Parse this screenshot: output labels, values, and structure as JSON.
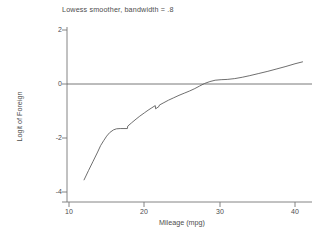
{
  "chart_data": {
    "type": "line",
    "title": "Lowess smoother, bandwidth = .8",
    "xlabel": "Mileage (mpg)",
    "ylabel": "Logit of Foreign",
    "xlim": [
      9,
      42
    ],
    "ylim": [
      -4.3,
      2.4
    ],
    "xticks": [
      10,
      20,
      30,
      40
    ],
    "xtick_labels": [
      "10",
      "20",
      "30",
      "40"
    ],
    "yticks": [
      2,
      0,
      -2,
      -4
    ],
    "ytick_labels": [
      "2",
      "0",
      "-2",
      "-4"
    ],
    "grid": false,
    "legend": null,
    "line_color": "#555555",
    "reference_lines": [
      {
        "name": "zero-line",
        "orientation": "horizontal",
        "y": 0,
        "color": "#555555"
      }
    ],
    "series": [
      {
        "name": "lowess-smooth",
        "x": [
          12.0,
          12.6,
          13.2,
          13.8,
          14.2,
          14.6,
          15.0,
          15.4,
          15.9,
          16.3,
          16.8,
          17.3,
          17.75,
          17.8,
          18.3,
          18.9,
          19.4,
          20.0,
          20.5,
          21.0,
          21.45,
          21.5,
          21.95,
          22.0,
          22.6,
          23.2,
          23.9,
          24.6,
          25.3,
          26.0,
          26.7,
          27.3,
          28.0,
          28.7,
          29.4,
          30.2,
          31.0,
          32.0,
          33.0,
          34.0,
          35.2,
          36.4,
          37.6,
          38.8,
          40.0,
          41.0
        ],
        "y": [
          -3.55,
          -3.2,
          -2.86,
          -2.52,
          -2.28,
          -2.1,
          -1.93,
          -1.8,
          -1.7,
          -1.66,
          -1.65,
          -1.65,
          -1.65,
          -1.56,
          -1.44,
          -1.3,
          -1.19,
          -1.07,
          -0.97,
          -0.88,
          -0.8,
          -0.92,
          -0.83,
          -0.78,
          -0.69,
          -0.6,
          -0.51,
          -0.42,
          -0.34,
          -0.26,
          -0.17,
          -0.08,
          0.02,
          0.09,
          0.14,
          0.16,
          0.17,
          0.2,
          0.25,
          0.31,
          0.39,
          0.47,
          0.56,
          0.65,
          0.75,
          0.82
        ]
      }
    ]
  }
}
